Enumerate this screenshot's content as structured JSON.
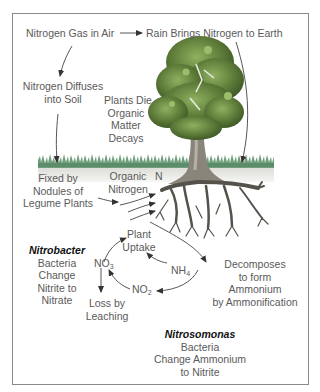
{
  "diagram": {
    "labels": {
      "nitrogen_gas": "Nitrogen Gas in Air",
      "rain": "Rain Brings Nitrogen to Earth",
      "diffuses_1": "Nitrogen Diffuses",
      "diffuses_2": "into Soil",
      "plants_die_1": "Plants Die",
      "plants_die_2": "Organic",
      "plants_die_3": "Matter",
      "plants_die_4": "Decays",
      "fixed_1": "Fixed by",
      "fixed_2": "Nodules of",
      "fixed_3": "Legume Plants",
      "organic_1": "Organic",
      "organic_2": "Nitrogen",
      "n_symbol": "N",
      "plant_uptake_1": "Plant",
      "plant_uptake_2": "Uptake",
      "nitrobacter_title": "Nitrobacter",
      "nitrobacter_1": "Bacteria",
      "nitrobacter_2": "Change",
      "nitrobacter_3": "Nitrite to",
      "nitrobacter_4": "Nitrate",
      "decomposes_1": "Decomposes",
      "decomposes_2": "to form",
      "decomposes_3": "Ammonium",
      "decomposes_4": "by Ammonification",
      "leaching_1": "Loss by",
      "leaching_2": "Leaching",
      "nitrosomonas_title": "Nitrosomonas",
      "nitrosomonas_1": "Bacteria",
      "nitrosomonas_2": "Change Ammonium",
      "nitrosomonas_3": "to Nitrite"
    },
    "chemicals": {
      "no3_base": "NO",
      "no3_sub": "3",
      "nh4_base": "NH",
      "nh4_sub": "4",
      "no2_base": "NO",
      "no2_sub": "2"
    },
    "colors": {
      "border": "#8a8a8a",
      "text": "#5a5a5a",
      "arrow": "#444444",
      "grass": "#6e9e7a",
      "soil": "#e6e6e0",
      "foliage": "#5f7d3a",
      "trunk": "#7a7468",
      "roots": "#5a5650"
    }
  }
}
